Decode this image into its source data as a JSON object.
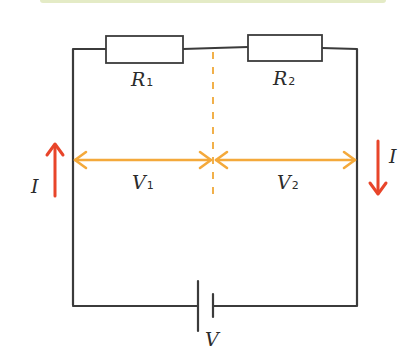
{
  "diagram": {
    "components": {
      "resistor_1": {
        "symbol": "R",
        "subscript": "1"
      },
      "resistor_2": {
        "symbol": "R",
        "subscript": "2"
      },
      "battery": {
        "label": "V"
      }
    },
    "voltages": {
      "v1": {
        "symbol": "V",
        "subscript": "1"
      },
      "v2": {
        "symbol": "V",
        "subscript": "2"
      }
    },
    "currents": {
      "left": {
        "label": "I",
        "direction": "up"
      },
      "right": {
        "label": "I",
        "direction": "down"
      }
    },
    "colors": {
      "wire": "#3b3b3b",
      "voltage_arrow": "#f4a93b",
      "divider": "#f1b04a",
      "current_arrow": "#e8452a",
      "top_bar": "#e4ebc6"
    }
  }
}
